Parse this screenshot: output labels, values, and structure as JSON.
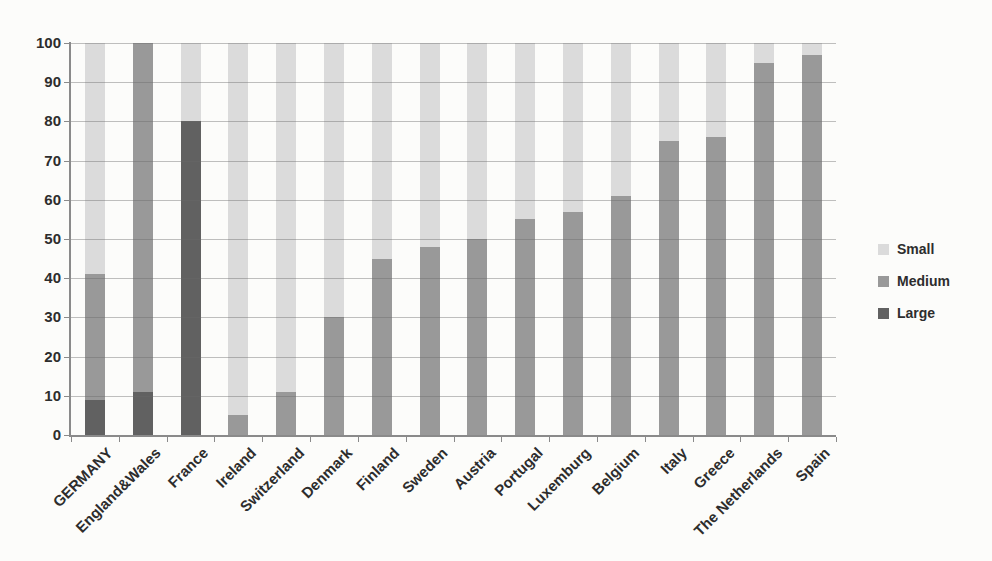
{
  "chart_data": {
    "type": "bar",
    "stacked": true,
    "title": "",
    "xlabel": "",
    "ylabel": "",
    "ylim": [
      0,
      100
    ],
    "yticks": [
      0,
      10,
      20,
      30,
      40,
      50,
      60,
      70,
      80,
      90,
      100
    ],
    "grid": true,
    "legend_position": "right",
    "categories": [
      "GERMANY",
      "England&Wales",
      "France",
      "Ireland",
      "Switzerland",
      "Denmark",
      "Finland",
      "Sweden",
      "Austria",
      "Portugal",
      "Luxemburg",
      "Belgium",
      "Italy",
      "Greece",
      "The Netherlands",
      "Spain"
    ],
    "series": [
      {
        "name": "Small",
        "color": "#dbdbdb",
        "values": [
          59,
          0,
          20,
          95,
          89,
          70,
          55,
          52,
          50,
          45,
          43,
          39,
          25,
          24,
          5,
          3
        ]
      },
      {
        "name": "Medium",
        "color": "#999999",
        "values": [
          32,
          89,
          0,
          5,
          11,
          30,
          45,
          48,
          50,
          55,
          57,
          61,
          75,
          76,
          95,
          97
        ]
      },
      {
        "name": "Large",
        "color": "#616161",
        "values": [
          9,
          11,
          80,
          0,
          0,
          0,
          0,
          0,
          0,
          0,
          0,
          0,
          0,
          0,
          0,
          0
        ]
      }
    ],
    "stack_bottom_to_top": [
      "Large",
      "Medium",
      "Small"
    ],
    "colors": {
      "small": "#dbdbdb",
      "medium": "#999999",
      "large": "#616161",
      "gridline": "#b1b1b1",
      "axis": "#8a8a8a",
      "text": "#2d2d2d"
    }
  }
}
